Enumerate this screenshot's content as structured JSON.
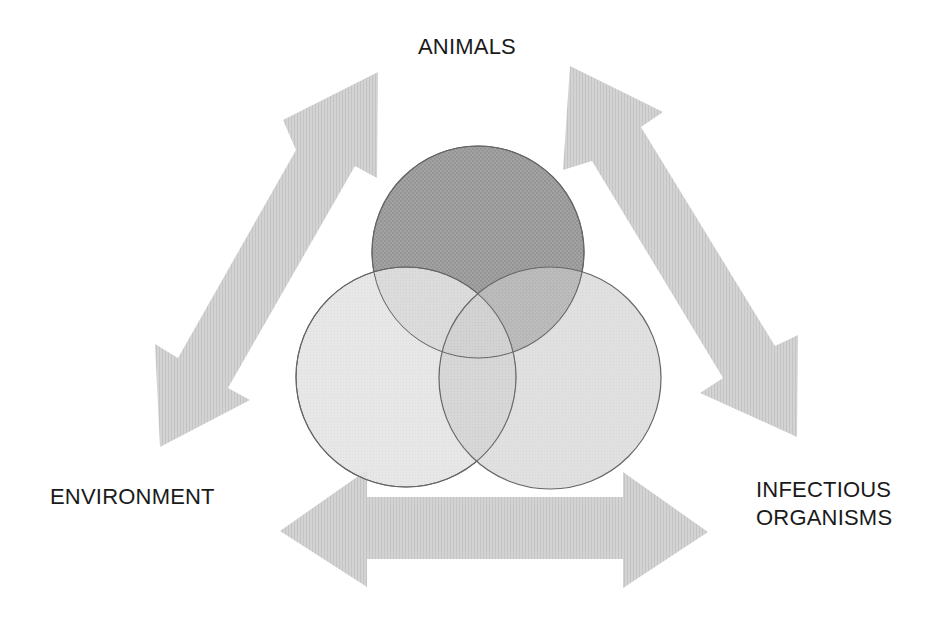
{
  "diagram": {
    "title": "",
    "nodes": [
      {
        "id": "animals",
        "label": "ANIMALS"
      },
      {
        "id": "environment",
        "label": "ENVIRONMENT"
      },
      {
        "id": "infectious_organisms",
        "label_lines": [
          "INFECTIOUS",
          "ORGANISMS"
        ]
      }
    ],
    "venn": {
      "circles": [
        {
          "id": "animals",
          "cx": 478,
          "cy": 252,
          "r": 106,
          "fill": "#9e9e9e"
        },
        {
          "id": "environment",
          "cx": 406,
          "cy": 377,
          "r": 110,
          "fill": "#e3e3e3"
        },
        {
          "id": "infectious_organisms",
          "cx": 550,
          "cy": 378,
          "r": 111,
          "fill": "#cbcbcb"
        }
      ],
      "stroke": "#6a6a6a"
    },
    "arrows": [
      {
        "id": "animals-environment",
        "direction": "bidirectional"
      },
      {
        "id": "animals-infectious_organisms",
        "direction": "bidirectional"
      },
      {
        "id": "environment-infectious_organisms",
        "direction": "bidirectional"
      }
    ],
    "arrow_color": "#cfcfcf"
  },
  "labels": {
    "animals": "ANIMALS",
    "environment": "ENVIRONMENT",
    "infectious_line1": "INFECTIOUS",
    "infectious_line2": "ORGANISMS"
  }
}
